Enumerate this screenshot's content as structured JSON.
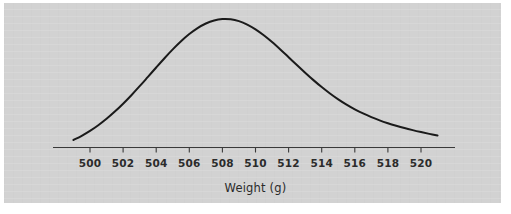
{
  "chart_data": {
    "type": "line",
    "title": "",
    "subtitle": "",
    "xlabel": "Weight (g)",
    "ylabel": "",
    "legend": [],
    "grid": false,
    "annotations": [],
    "xlim": [
      499,
      521
    ],
    "ylim": [
      0,
      0.1
    ],
    "x_ticks": [
      500,
      502,
      504,
      506,
      508,
      510,
      512,
      514,
      516,
      518,
      520
    ],
    "x_tick_labels": [
      "500",
      "502",
      "504",
      "506",
      "508",
      "510",
      "512",
      "514",
      "516",
      "518",
      "520"
    ],
    "y_ticks": [],
    "y_tick_labels": [],
    "distribution": {
      "kind": "normal",
      "mean": 510,
      "sigma": 4
    },
    "series": [
      {
        "name": "Normal density",
        "color": "#1a1a1a",
        "x": [
          499.0,
          499.5,
          500.0,
          500.5,
          501.0,
          501.5,
          502.0,
          502.5,
          503.0,
          503.5,
          504.0,
          504.5,
          505.0,
          505.5,
          506.0,
          506.5,
          507.0,
          507.5,
          508.0,
          508.5,
          509.0,
          509.5,
          510.0,
          510.5,
          511.0,
          511.5,
          512.0,
          512.5,
          513.0,
          513.5,
          514.0,
          514.5,
          515.0,
          515.5,
          516.0,
          516.5,
          517.0,
          517.5,
          518.0,
          518.5,
          519.0,
          519.5,
          520.0,
          520.5,
          521.0
        ],
        "values": [
          0.0076,
          0.00952,
          0.01176,
          0.01435,
          0.01729,
          0.02059,
          0.0242,
          0.0281,
          0.03222,
          0.03648,
          0.04078,
          0.04501,
          0.04904,
          0.05276,
          0.05605,
          0.05879,
          0.0609,
          0.0623,
          0.06295,
          0.06284,
          0.06197,
          0.0604,
          0.05821,
          0.0555,
          0.0524,
          0.04901,
          0.04547,
          0.04189,
          0.03837,
          0.03499,
          0.03181,
          0.02887,
          0.0262,
          0.02379,
          0.02164,
          0.01974,
          0.01806,
          0.01658,
          0.01527,
          0.01411,
          0.01306,
          0.01211,
          0.01123,
          0.0104,
          0.00962
        ]
      }
    ]
  },
  "axis": {
    "line_color": "#3a3a3a",
    "tick_color": "#3a3a3a"
  },
  "style": {
    "panel_color": "#d2d2d2",
    "page_color": "#ffffff",
    "curve_color": "#1a1a1a",
    "text_color": "#2b2b2b"
  }
}
